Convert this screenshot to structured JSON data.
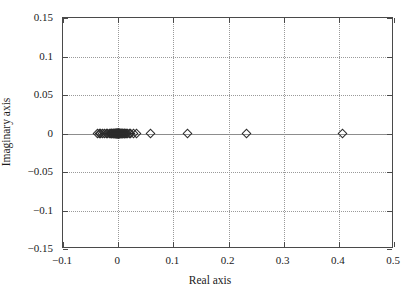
{
  "figure": {
    "background_color": "#ffffff",
    "frame_color": "#4a4a4a",
    "grid_color": "#9a9a9a",
    "marker_color": "#2b2b2b"
  },
  "chart_data": {
    "type": "scatter",
    "title": "",
    "xlabel": "Real axis",
    "ylabel": "Imaginary axis",
    "xlim": [
      -0.1,
      0.5
    ],
    "ylim": [
      -0.15,
      0.15
    ],
    "xticks": [
      -0.1,
      0,
      0.1,
      0.2,
      0.3,
      0.4,
      0.5
    ],
    "xticklabels": [
      "−0.1",
      "0",
      "0.1",
      "0.2",
      "0.3",
      "0.4",
      "0.5"
    ],
    "yticks": [
      -0.15,
      -0.1,
      -0.05,
      0,
      0.05,
      0.1,
      0.15
    ],
    "yticklabels": [
      "−0.15",
      "−0.1",
      "−0.05",
      "0",
      "0.05",
      "0.1",
      "0.15"
    ],
    "grid": true,
    "grid_style": "dotted",
    "legend": null,
    "marker": "diamond",
    "marker_filled": false,
    "series": [
      {
        "name": "poles",
        "x": [
          -0.0375,
          -0.0345,
          -0.0315,
          -0.0285,
          -0.0255,
          -0.0215,
          -0.0185,
          -0.016,
          -0.014,
          -0.0125,
          -0.0112,
          -0.01,
          -0.009,
          -0.008,
          -0.0072,
          -0.0064,
          -0.0057,
          -0.005,
          -0.0044,
          -0.0038,
          -0.0033,
          -0.0028,
          -0.0024,
          -0.002,
          -0.0016,
          -0.0012,
          -0.0008,
          -0.0005,
          -0.0002,
          0.0,
          0.0002,
          0.0005,
          0.0008,
          0.0012,
          0.0016,
          0.0021,
          0.0026,
          0.0032,
          0.0038,
          0.0045,
          0.0053,
          0.0062,
          0.0072,
          0.0083,
          0.0095,
          0.0108,
          0.0122,
          0.0138,
          0.0155,
          0.0175,
          0.02,
          0.023,
          0.028,
          0.033,
          0.059,
          0.125,
          0.232,
          0.407
        ],
        "y": [
          0,
          0,
          0,
          0,
          0,
          0,
          0,
          0,
          0,
          0,
          0,
          0,
          0,
          0,
          0,
          0,
          0,
          0,
          0,
          0,
          0,
          0,
          0,
          0,
          0,
          0,
          0,
          0,
          0,
          0,
          0,
          0,
          0,
          0,
          0,
          0,
          0,
          0,
          0,
          0,
          0,
          0,
          0,
          0,
          0,
          0,
          0,
          0,
          0,
          0,
          0,
          0,
          0,
          0,
          0,
          0,
          0,
          0
        ]
      }
    ]
  }
}
